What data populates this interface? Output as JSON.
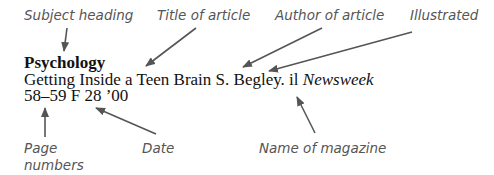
{
  "labels": {
    "subject_heading": "Subject heading",
    "title_of_article": "Title of article",
    "author_of_article": "Author of article",
    "illustrated": "Illustrated",
    "page_numbers_line1": "Page",
    "page_numbers_line2": "numbers",
    "date": "Date",
    "name_of_magazine": "Name of magazine"
  },
  "entry": {
    "subject": "Psychology",
    "title": "Getting Inside a Teen Brain",
    "author": "S. Begley.",
    "illustrated_abbrev": "il",
    "magazine": "Newsweek",
    "pages": "58–59",
    "date": "F 28 ’00"
  },
  "colors": {
    "arrow": "#555555",
    "label_text": "#555555",
    "entry_text": "#111111"
  }
}
